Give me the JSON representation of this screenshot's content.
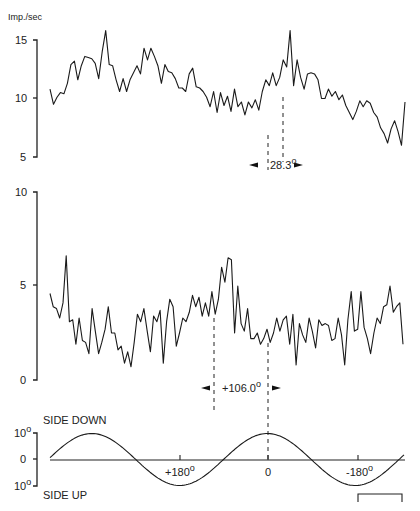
{
  "chart_data": [
    {
      "type": "line",
      "title": "",
      "ylabel": "Imp./sec",
      "ylim": [
        5,
        15
      ],
      "yticks": [
        "15",
        "10",
        "5"
      ],
      "grid": false,
      "annotation": {
        "label": "28.3°",
        "value": "28.3",
        "unit": "°"
      },
      "series": [
        {
          "name": "firing rate (top)",
          "values": [
            10.8,
            9.5,
            10.1,
            10.5,
            10.4,
            11.3,
            12.9,
            13.2,
            11.6,
            12.8,
            13.6,
            13.5,
            13.4,
            13.0,
            11.7,
            14.0,
            15.8,
            12.9,
            12.8,
            11.6,
            10.6,
            11.7,
            10.6,
            11.6,
            12.2,
            12.8,
            12.1,
            14.3,
            13.3,
            14.3,
            13.6,
            12.8,
            11.3,
            12.9,
            12.3,
            12.2,
            11.7,
            10.9,
            10.9,
            10.6,
            12.1,
            12.6,
            11.0,
            10.9,
            10.6,
            10.1,
            9.3,
            10.6,
            8.8,
            10.5,
            9.4,
            10.2,
            8.9,
            10.8,
            9.3,
            9.7,
            8.6,
            9.7,
            9.2,
            9.9,
            9.0,
            10.6,
            11.6,
            11.1,
            12.2,
            11.1,
            11.8,
            13.3,
            12.7,
            15.8,
            11.1,
            13.3,
            11.8,
            10.8,
            12.1,
            12.2,
            12.1,
            11.6,
            10.0,
            10.0,
            10.8,
            10.2,
            10.6,
            9.9,
            10.3,
            9.4,
            8.8,
            8.2,
            8.9,
            9.8,
            9.3,
            9.8,
            9.6,
            8.8,
            8.4,
            7.5,
            7.0,
            6.2,
            7.4,
            8.1,
            7.2,
            6.0,
            9.7
          ]
        }
      ]
    },
    {
      "type": "line",
      "ylim": [
        0,
        10
      ],
      "yticks": [
        "10",
        "5",
        "0"
      ],
      "grid": false,
      "annotation": {
        "label": "+106.0°",
        "value": "+106.0",
        "unit": "°"
      },
      "series": [
        {
          "name": "firing rate (middle)",
          "values": [
            4.6,
            3.9,
            3.8,
            3.3,
            4.1,
            6.6,
            3.1,
            3.2,
            1.9,
            3.3,
            2.1,
            2.0,
            1.4,
            3.8,
            2.6,
            1.4,
            2.0,
            2.7,
            3.9,
            2.5,
            2.5,
            1.6,
            1.8,
            0.9,
            1.5,
            0.7,
            2.0,
            3.5,
            3.1,
            3.8,
            2.6,
            1.5,
            3.4,
            3.1,
            3.7,
            0.9,
            3.1,
            4.3,
            3.9,
            1.8,
            2.5,
            3.3,
            3.1,
            3.6,
            4.5,
            3.9,
            4.4,
            3.4,
            4.1,
            3.4,
            4.7,
            3.5,
            4.3,
            6.0,
            5.2,
            6.5,
            6.4,
            2.5,
            5.0,
            3.0,
            2.6,
            3.8,
            2.2,
            2.2,
            2.5,
            1.9,
            2.2,
            2.7,
            2.0,
            2.5,
            3.3,
            2.6,
            3.2,
            3.4,
            1.9,
            3.5,
            0.8,
            3.0,
            2.4,
            2.0,
            3.3,
            2.6,
            1.7,
            3.2,
            2.9,
            3.0,
            2.9,
            2.1,
            2.2,
            3.3,
            2.4,
            0.8,
            3.2,
            4.7,
            2.6,
            2.7,
            4.7,
            2.8,
            2.2,
            1.4,
            2.5,
            3.3,
            3.0,
            3.9,
            4.0,
            5.0,
            3.6,
            3.9,
            4.1,
            1.9
          ]
        }
      ]
    },
    {
      "type": "line",
      "title": "",
      "ylim": [
        -10,
        10
      ],
      "yticks": [
        "10°",
        "0",
        "10°"
      ],
      "labels": {
        "top": "SIDE DOWN",
        "bottom": "SIDE UP"
      },
      "xticks": [
        "+180°",
        "0",
        "-180°"
      ],
      "series": [
        {
          "name": "stimulus tilt (sine)",
          "x_deg": [
            360,
            270,
            180,
            90,
            0,
            -90,
            -180,
            -270
          ],
          "values": [
            0,
            10,
            0,
            -10,
            0,
            10,
            0,
            -10
          ]
        }
      ]
    }
  ],
  "labels": {
    "yunit": "Imp./sec",
    "top_ticks": [
      "15",
      "10",
      "5"
    ],
    "mid_ticks": [
      "10",
      "5",
      "0"
    ],
    "bot_ticks": [
      "10",
      "0",
      "10"
    ],
    "deg": "o",
    "phase1": "28.3",
    "phase2": "+106.0",
    "side_down": "SIDE DOWN",
    "side_up": "SIDE UP",
    "x_plus180": "+180",
    "x_zero": "0",
    "x_minus180": "-180"
  }
}
